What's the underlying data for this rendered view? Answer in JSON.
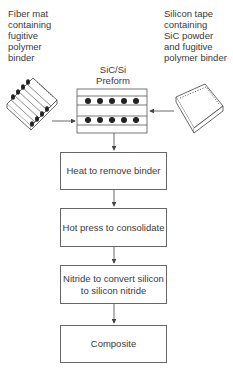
{
  "diagram": {
    "inputs": {
      "left": {
        "label": "Fiber mat\ncontaining\nfugitive\npolymer\nbinder",
        "icon": "fiber-mat-icon"
      },
      "right": {
        "label": "Silicon tape\ncontaining\nSiC powder\nand fugitive\npolymer binder",
        "icon": "silicon-tape-icon"
      }
    },
    "preform": {
      "label": "SiC/Si\nPreform",
      "fiber_rows": 2,
      "fibers_per_row": 5
    },
    "steps": [
      {
        "label": "Heat to remove binder"
      },
      {
        "label": "Hot press to consolidate"
      },
      {
        "label": "Nitride to convert silicon\nto silicon nitride"
      },
      {
        "label": "Composite"
      }
    ],
    "colors": {
      "line": "#555555",
      "text": "#3a3a3a",
      "fiber": "#222222"
    }
  }
}
